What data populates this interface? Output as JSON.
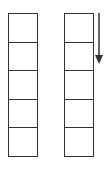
{
  "diagram": {
    "type": "two-columns-of-cells",
    "columns": [
      {
        "id": "left",
        "cells": 5
      },
      {
        "id": "right",
        "cells": 5
      }
    ],
    "arrow": {
      "direction": "down",
      "beside": "right",
      "length_cells": 1.7
    },
    "colors": {
      "stroke": "#333333",
      "fill": "#ffffff"
    }
  }
}
